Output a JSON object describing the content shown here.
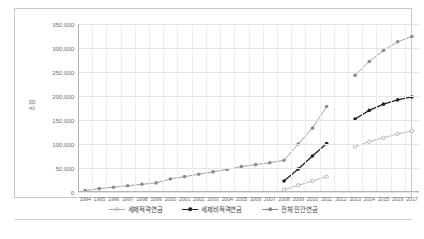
{
  "chart_data": {
    "type": "line",
    "title": "",
    "xlabel": "",
    "ylabel": "조원",
    "ylim": [
      0,
      350000
    ],
    "ytick_values": [
      0,
      50000,
      100000,
      150000,
      200000,
      250000,
      300000,
      350000
    ],
    "ytick_labels": [
      "0",
      "50,000",
      "100,000",
      "150,000",
      "200,000",
      "250,000",
      "300,000",
      "350,000"
    ],
    "grid": true,
    "legend_position": "bottom",
    "categories": [
      "1994",
      "1995",
      "1996",
      "1997",
      "1998",
      "1999",
      "2000",
      "2001",
      "2002",
      "2003",
      "2004",
      "2005",
      "2006",
      "2007",
      "2008",
      "2009",
      "2010",
      "2011",
      "2012",
      "2013",
      "2014",
      "2015",
      "2016",
      "2017"
    ],
    "series": [
      {
        "name": "세제적격연금",
        "color": "#a6a6a6",
        "marker": "open-circle",
        "values": [
          null,
          null,
          null,
          null,
          null,
          null,
          null,
          null,
          null,
          null,
          null,
          null,
          null,
          null,
          5000,
          14000,
          23000,
          32000,
          null,
          95000,
          105000,
          113000,
          121000,
          127000
        ]
      },
      {
        "name": "세제비적격연금",
        "color": "#222222",
        "marker": "filled-circle",
        "values": [
          null,
          null,
          null,
          null,
          null,
          null,
          null,
          null,
          null,
          null,
          null,
          null,
          null,
          null,
          23000,
          48000,
          75000,
          101000,
          null,
          152000,
          170000,
          183000,
          192000,
          198000
        ]
      },
      {
        "name": "전체 민간연금",
        "color": "#8c8c8c",
        "marker": "filled-circle",
        "values": [
          3000,
          7000,
          10000,
          13000,
          16000,
          19000,
          27000,
          32000,
          37000,
          42000,
          47000,
          53000,
          57000,
          61000,
          66000,
          100000,
          133000,
          178000,
          null,
          243000,
          272000,
          295000,
          313000,
          324000
        ]
      }
    ]
  },
  "legend": {
    "items": [
      {
        "label": "세제적격연금"
      },
      {
        "label": "세제비적격연금"
      },
      {
        "label": "전체 민간연금"
      }
    ]
  }
}
